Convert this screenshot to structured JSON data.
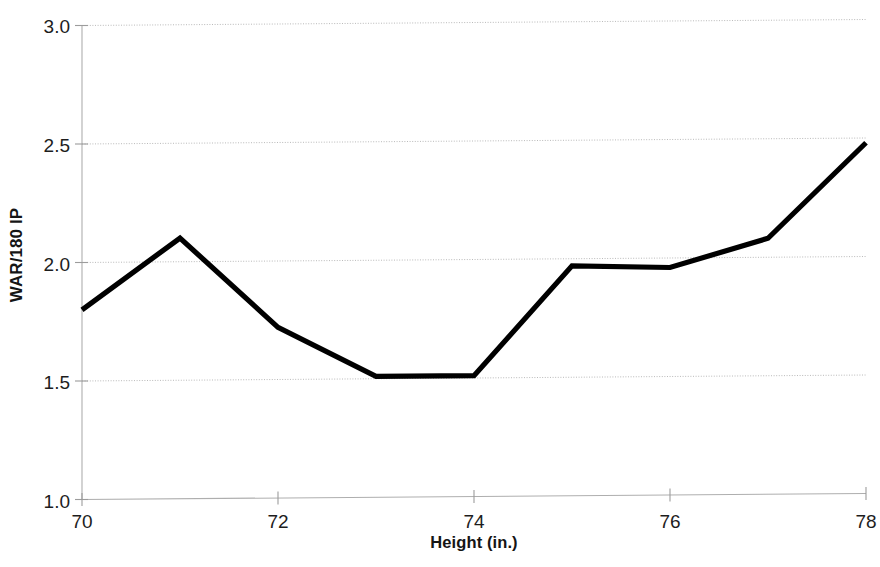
{
  "chart_data": {
    "type": "line",
    "title": "",
    "xlabel": "Height (in.)",
    "ylabel": "WAR/180 IP",
    "x": [
      70,
      71,
      72,
      73,
      74,
      75,
      76,
      77,
      78
    ],
    "values": [
      1.8,
      2.1,
      1.72,
      1.51,
      1.51,
      1.97,
      1.96,
      2.08,
      2.48
    ],
    "series": [
      {
        "name": "WAR/180 IP by height",
        "values": [
          1.8,
          2.1,
          1.72,
          1.51,
          1.51,
          1.97,
          1.96,
          2.08,
          2.48
        ]
      }
    ],
    "xlim": [
      70,
      78
    ],
    "ylim": [
      1.0,
      3.0
    ],
    "x_tick_labels": [
      "70",
      "72",
      "74",
      "76",
      "78"
    ],
    "x_tick_values": [
      70,
      72,
      74,
      76,
      78
    ],
    "x_minor_tick_values": [
      71,
      73,
      75,
      77
    ],
    "y_tick_labels": [
      "3.0",
      "2.5",
      "2.0",
      "1.5",
      "1.0"
    ],
    "y_tick_values": [
      3.0,
      2.5,
      2.0,
      1.5,
      1.0
    ],
    "grid": "horizontal-only",
    "legend": "none",
    "line_color": "#000000",
    "gridline_color": "#b9b9b9",
    "axis_color": "#aeaeae",
    "background_color": "#ffffff"
  },
  "axes": {
    "y_title": "WAR/180 IP",
    "x_title": "Height (in.)",
    "y_ticks": [
      {
        "label": "3.0"
      },
      {
        "label": "2.5"
      },
      {
        "label": "2.0"
      },
      {
        "label": "1.5"
      },
      {
        "label": "1.0"
      }
    ],
    "x_ticks": [
      {
        "label": "70"
      },
      {
        "label": "72"
      },
      {
        "label": "74"
      },
      {
        "label": "76"
      },
      {
        "label": "78"
      }
    ]
  }
}
